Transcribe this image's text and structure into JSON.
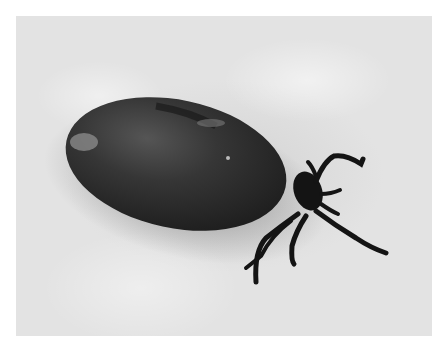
{
  "image": {
    "description": "Black-and-white photograph of an engorged tick on a textured white surface",
    "subject": "engorged tick",
    "background": "textured white paper",
    "colors": {
      "body": "#2e2e2e",
      "legs": "#141414",
      "surface": "#dcdcdc",
      "border": "#ffffff"
    }
  }
}
